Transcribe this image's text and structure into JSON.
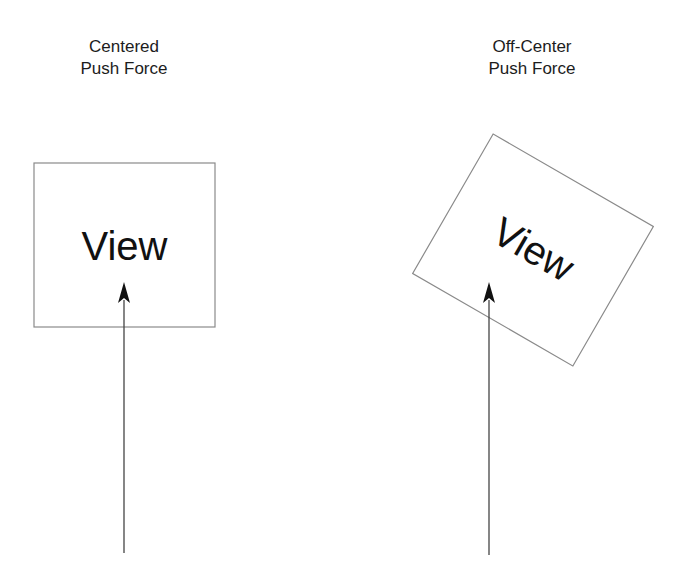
{
  "panels": [
    {
      "id": "centered",
      "title_lines": [
        "Centered",
        "Push Force"
      ],
      "box_label": "View",
      "box": {
        "x": 34,
        "y": 163,
        "width": 181,
        "height": 164,
        "rotation_deg": 0
      },
      "arrow": {
        "x": 124,
        "y_start": 553,
        "y_tip": 282
      }
    },
    {
      "id": "off-center",
      "title_lines": [
        "Off-Center",
        "Push Force"
      ],
      "box_label": "View",
      "box": {
        "cx": 533,
        "cy": 250,
        "width": 185,
        "height": 161,
        "rotation_deg": 30
      },
      "arrow": {
        "x": 489,
        "y_start": 555,
        "y_tip": 282
      }
    }
  ],
  "colors": {
    "box_stroke": "#8a8a8a",
    "arrow": "#333333",
    "text": "#1a1a1a",
    "background": "#ffffff"
  }
}
